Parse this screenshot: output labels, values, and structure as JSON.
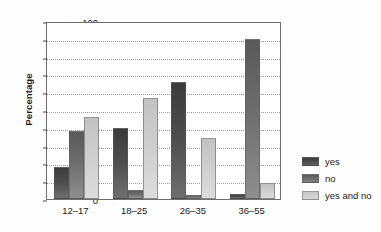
{
  "chart_data": {
    "type": "bar",
    "title": "",
    "xlabel": "",
    "ylabel": "Percentage",
    "ylim": [
      0,
      100
    ],
    "ytick_step": 10,
    "yticks": [
      0,
      10,
      20,
      30,
      40,
      50,
      60,
      70,
      80,
      90,
      100
    ],
    "grid": true,
    "legend_position": "right",
    "categories": [
      "12–17",
      "18–25",
      "26–35",
      "36–55"
    ],
    "series": [
      {
        "name": "yes",
        "values": [
          18,
          40,
          66,
          3
        ],
        "color": "#434343"
      },
      {
        "name": "no",
        "values": [
          38,
          5,
          2,
          90
        ],
        "color": "#6b6b6b"
      },
      {
        "name": "yes and no",
        "values": [
          46,
          57,
          34,
          9
        ],
        "color": "#cfcfcf"
      }
    ]
  },
  "legend": {
    "items": [
      {
        "label": "yes"
      },
      {
        "label": "no"
      },
      {
        "label": "yes and no"
      }
    ]
  }
}
